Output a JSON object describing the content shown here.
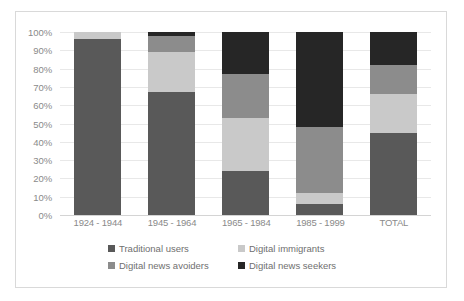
{
  "chart_data": {
    "type": "bar",
    "subtype": "stacked-100-percent",
    "title": "",
    "xlabel": "",
    "ylabel": "",
    "ylim": [
      0,
      100
    ],
    "ytick_labels": [
      "100%",
      "90%",
      "80%",
      "70%",
      "60%",
      "50%",
      "40%",
      "30%",
      "20%",
      "10%",
      "0%"
    ],
    "ytick_values": [
      100,
      90,
      80,
      70,
      60,
      50,
      40,
      30,
      20,
      10,
      0
    ],
    "grid": true,
    "legend_position": "bottom",
    "categories": [
      "1924 - 1944",
      "1945 - 1964",
      "1965 - 1984",
      "1985 - 1999",
      "TOTAL"
    ],
    "series": [
      {
        "name": "Traditional users",
        "color": "#595959",
        "values": [
          96,
          67,
          24,
          6,
          45
        ]
      },
      {
        "name": "Digital immigrants",
        "color": "#c9c9c9",
        "values": [
          4,
          22,
          29,
          6,
          21
        ]
      },
      {
        "name": "Digital news avoiders",
        "color": "#8c8c8c",
        "values": [
          0,
          9,
          24,
          36,
          16
        ]
      },
      {
        "name": "Digital news seekers",
        "color": "#262626",
        "values": [
          0,
          2,
          23,
          52,
          18
        ]
      }
    ]
  },
  "colors": {
    "traditional_users": "#595959",
    "digital_immigrants": "#c9c9c9",
    "digital_news_avoiders": "#8c8c8c",
    "digital_news_seekers": "#262626",
    "gridline": "#e8e8e8",
    "axis_text": "#8a8a8a",
    "legend_text": "#6f6f6f",
    "frame_border": "#d9d9d9",
    "background": "#ffffff"
  }
}
